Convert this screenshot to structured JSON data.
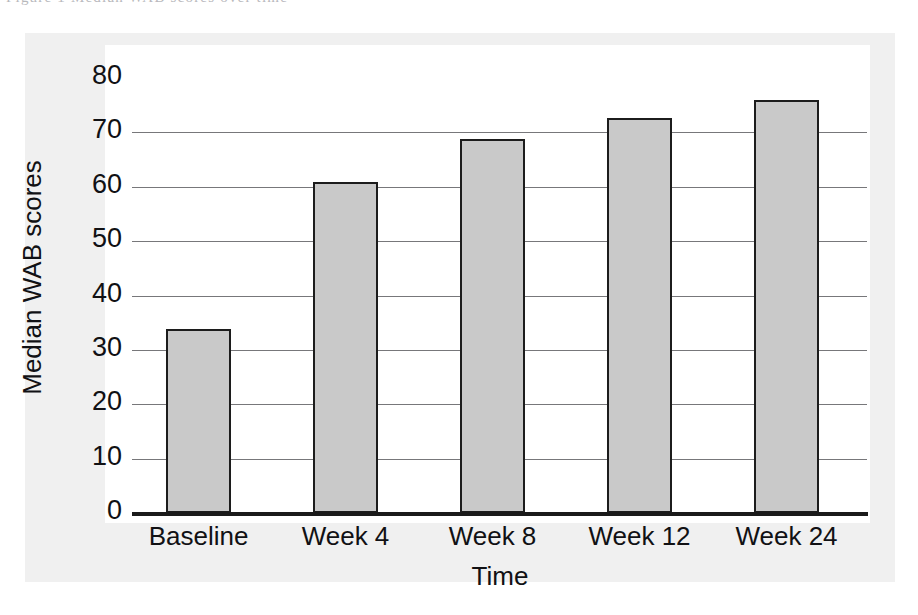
{
  "scan": {
    "top_sliver_text": "Figure 1  Median WAB scores over time"
  },
  "chart_data": {
    "type": "bar",
    "title": "",
    "xlabel": "Time",
    "ylabel": "Median WAB scores",
    "categories": [
      "Baseline",
      "Week 4",
      "Week 8",
      "Week 12",
      "Week 24"
    ],
    "values": [
      33.8,
      60.8,
      68.8,
      72.7,
      76.0
    ],
    "yticks": [
      0,
      10,
      20,
      30,
      40,
      50,
      60,
      70,
      80
    ],
    "ytick_labels": [
      "0",
      "10",
      "20",
      "30",
      "40",
      "50",
      "60",
      "70",
      "80"
    ],
    "ylim": [
      0,
      80
    ],
    "grid": true,
    "legend": "none",
    "bar_color": "#c9c9c9",
    "bar_edge_color": "#1c1c1c",
    "axis_color": "#1a1a1a",
    "gridline_color": "#77777a",
    "plot_background": "#ffffff",
    "page_background": "#f0f0f0"
  }
}
